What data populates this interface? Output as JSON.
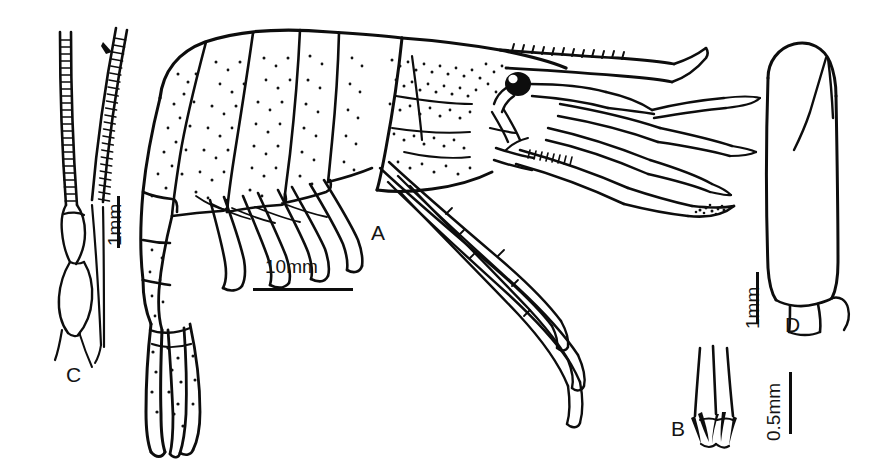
{
  "figure": {
    "kind": "scientific-line-drawing",
    "background_color": "#ffffff",
    "ink_color": "#0d0d0d",
    "width": 878,
    "height": 472
  },
  "panels": [
    {
      "id": "A",
      "label": "A",
      "description": "whole animal, lateral view",
      "label_x": 371,
      "label_y": 221
    },
    {
      "id": "B",
      "label": "B",
      "description": "distal tip with spines, enlarged",
      "label_x": 671,
      "label_y": 417
    },
    {
      "id": "C",
      "label": "C",
      "description": "antennular peduncle with segmented flagella",
      "label_x": 66,
      "label_y": 363
    },
    {
      "id": "D",
      "label": "D",
      "description": "antennal scale (scaphocerite)",
      "label_x": 785,
      "label_y": 313
    }
  ],
  "scale_bars": [
    {
      "id": "scale-a",
      "label": "10mm",
      "orientation": "horizontal",
      "panel": "A",
      "text_x": 265,
      "text_y": 256,
      "bar_x": 253,
      "bar_y": 288,
      "bar_length": 100
    },
    {
      "id": "scale-c",
      "label": "1mm",
      "orientation": "vertical",
      "panel": "C",
      "text_x": 104,
      "text_y": 246,
      "bar_x": 117,
      "bar_y": 196,
      "bar_length": 52
    },
    {
      "id": "scale-d",
      "label": "1mm",
      "orientation": "vertical",
      "panel": "D",
      "text_x": 742,
      "text_y": 329,
      "bar_x": 756,
      "bar_y": 272,
      "bar_length": 52
    },
    {
      "id": "scale-b",
      "label": "0.5mm",
      "orientation": "vertical",
      "panel": "B",
      "text_x": 763,
      "text_y": 441,
      "bar_x": 789,
      "bar_y": 372,
      "bar_length": 62
    }
  ]
}
